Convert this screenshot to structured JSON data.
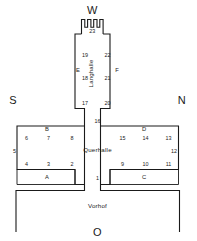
{
  "plan": {
    "title": "Tempelgrundriss",
    "compass": {
      "west": "W",
      "south": "S",
      "north": "N",
      "east": "O"
    },
    "halls": {
      "langhalle": "Langhalle",
      "querhalle": "Querhalle",
      "vorhof": "Vorhof"
    },
    "zones": [
      {
        "id": "A",
        "label": "A"
      },
      {
        "id": "B",
        "label": "B"
      },
      {
        "id": "C",
        "label": "C"
      },
      {
        "id": "D",
        "label": "D"
      },
      {
        "id": "E",
        "label": "E"
      },
      {
        "id": "F",
        "label": "F"
      }
    ],
    "rooms": [
      {
        "n": "1"
      },
      {
        "n": "2"
      },
      {
        "n": "3"
      },
      {
        "n": "4"
      },
      {
        "n": "5"
      },
      {
        "n": "6"
      },
      {
        "n": "7"
      },
      {
        "n": "8"
      },
      {
        "n": "9"
      },
      {
        "n": "10"
      },
      {
        "n": "11"
      },
      {
        "n": "12"
      },
      {
        "n": "13"
      },
      {
        "n": "14"
      },
      {
        "n": "15"
      },
      {
        "n": "16"
      },
      {
        "n": "17"
      },
      {
        "n": "18"
      },
      {
        "n": "19"
      },
      {
        "n": "20"
      },
      {
        "n": "21"
      },
      {
        "n": "22"
      },
      {
        "n": "23"
      }
    ],
    "colors": {
      "ink": "#1a1a1a",
      "paper": "#ffffff"
    }
  }
}
